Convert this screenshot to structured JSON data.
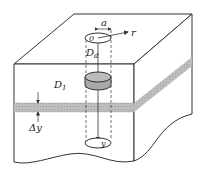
{
  "diagram": {
    "labels": {
      "a": "a",
      "r": "r",
      "origin": "0",
      "D_main": "D",
      "D_sub": "d",
      "D1_main": "D",
      "D1_sub": "1",
      "delta_y": "Δy",
      "y": "y"
    },
    "colors": {
      "line": "#333333",
      "layer_fill": "#b9b9b9",
      "cylinder_fill": "#a8a8a8",
      "background": "#ffffff"
    }
  }
}
